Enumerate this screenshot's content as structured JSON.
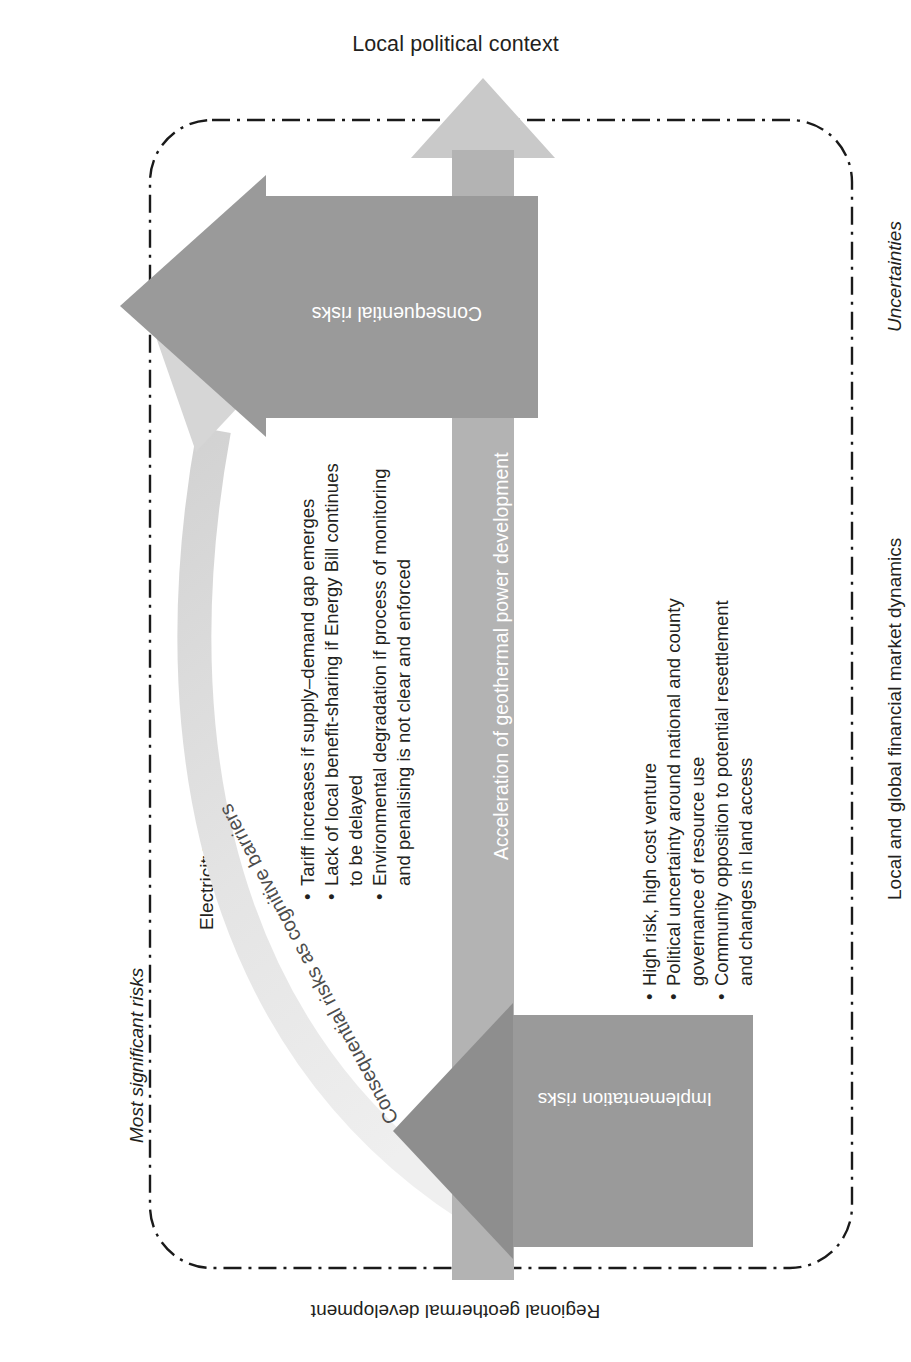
{
  "diagram": {
    "title_top": "Local political context",
    "title_bottom": "Regional geothermal development",
    "side_right_top": "Uncertainties",
    "side_right_bottom": "Local and global financial market dynamics",
    "side_left_top": "Most significant risks",
    "side_left_bottom": "Electricity demand growth",
    "center_bar_label": "Acceleration of geothermal power development",
    "arrow_upper_label": "Consequential risks",
    "arrow_lower_label": "Implementation risks",
    "curve_label": "Consequential risks as cognitive barriers",
    "consequential_risks": [
      "Tariff increases if supply–demand gap emerges",
      "Lack of local benefit-sharing if Energy Bill continues",
      "to be delayed",
      "Environmental degradation if process of monitoring",
      "and penalising is not clear and enforced"
    ],
    "consequential_risks_bulleted": [
      true,
      true,
      false,
      true,
      false
    ],
    "implementation_risks": [
      "High risk, high cost venture",
      "Political uncertainty around national and county",
      "governance of resource use",
      "Community opposition to potential resettlement",
      "and changes in land access"
    ],
    "implementation_risks_bulleted": [
      true,
      true,
      false,
      true,
      false
    ],
    "colors": {
      "arrow_grey": "#9a9a9a",
      "bar_grey": "#b3b3b3",
      "bar_head_grey": "#c9c9c9",
      "curve_grey": "#e2e2e2",
      "text": "#231f20",
      "boundary": "#1a1a1a"
    }
  }
}
